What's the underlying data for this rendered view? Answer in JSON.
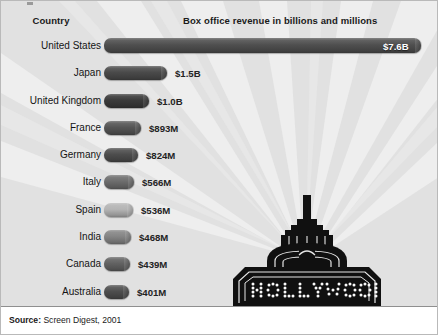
{
  "figure": {
    "background_color": "#e9e9e9",
    "beam_color": "#f4f4f4",
    "bar_color": "#4a4a4a"
  },
  "headers": {
    "country": "Country",
    "value": "Box office revenue in billions and millions"
  },
  "footer": {
    "source_label": "Source:",
    "source_text": "Screen Digest, 2001"
  },
  "graphic": {
    "sign_text": "HOLLYWOOD",
    "sign_name": "hollywood-marquee-sign"
  },
  "chart_data": {
    "type": "bar",
    "orientation": "horizontal",
    "title": "Box office revenue in billions and millions",
    "xlabel": "Box office revenue in billions and millions",
    "ylabel": "Country",
    "grid": false,
    "legend": false,
    "source": "Screen Digest, 2001",
    "unit": "USD",
    "categories": [
      "United States",
      "Japan",
      "United Kingdom",
      "France",
      "Germany",
      "Italy",
      "Spain",
      "India",
      "Canada",
      "Australia"
    ],
    "values": [
      7600,
      1500,
      1000,
      893,
      824,
      566,
      536,
      468,
      439,
      401
    ],
    "labels": [
      "$7.6B",
      "$1.5B",
      "$1.0B",
      "$893M",
      "$824M",
      "$566M",
      "$536M",
      "$468M",
      "$439M",
      "$401M"
    ],
    "xlim": [
      0,
      7600
    ],
    "rows": [
      {
        "country": "United States",
        "value": 7600,
        "label": "$7.6B",
        "bar_px": 317,
        "label_inside": true,
        "shade": "#4f4f4f"
      },
      {
        "country": "Japan",
        "value": 1500,
        "label": "$1.5B",
        "bar_px": 63,
        "label_inside": false,
        "shade": "#4a4a4a"
      },
      {
        "country": "United Kingdom",
        "value": 1000,
        "label": "$1.0B",
        "bar_px": 45,
        "label_inside": false,
        "shade": "#3a3a3a"
      },
      {
        "country": "France",
        "value": 893,
        "label": "$893M",
        "bar_px": 37,
        "label_inside": false,
        "shade": "#555555"
      },
      {
        "country": "Germany",
        "value": 824,
        "label": "$824M",
        "bar_px": 34,
        "label_inside": false,
        "shade": "#4d4d4d"
      },
      {
        "country": "Italy",
        "value": 566,
        "label": "$566M",
        "bar_px": 30,
        "label_inside": false,
        "shade": "#6d6d6d"
      },
      {
        "country": "Spain",
        "value": 536,
        "label": "$536M",
        "bar_px": 29,
        "label_inside": false,
        "shade": "#b4b4b4"
      },
      {
        "country": "India",
        "value": 468,
        "label": "$468M",
        "bar_px": 27,
        "label_inside": false,
        "shade": "#858585"
      },
      {
        "country": "Canada",
        "value": 439,
        "label": "$439M",
        "bar_px": 26,
        "label_inside": false,
        "shade": "#626262"
      },
      {
        "country": "Australia",
        "value": 401,
        "label": "$401M",
        "bar_px": 25,
        "label_inside": false,
        "shade": "#4e4e4e"
      }
    ]
  }
}
